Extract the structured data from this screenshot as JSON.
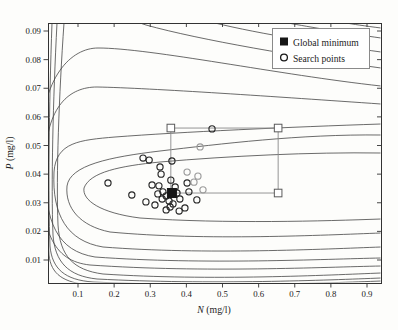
{
  "figure": {
    "background": "#fdfdfb",
    "axis_color": "#333333",
    "contour_color": "#454545",
    "point_color": "#262626",
    "shaded_point_color": "#9b9b9b",
    "region_color": "#8a8a8a",
    "minimum_color": "#161616"
  },
  "legend": {
    "items": [
      {
        "label": "Global minimum",
        "marker": "filled-square"
      },
      {
        "label": "Search points",
        "marker": "open-circle"
      }
    ]
  },
  "axes": {
    "x": {
      "variable": "N",
      "unit": " (mg/l)",
      "tick_labels": [
        "0.1",
        "0.2",
        "0.3",
        "0.4",
        "0.5",
        "0.6",
        "0.7",
        "0.8",
        "0.9"
      ],
      "tick_values": [
        0.1,
        0.2,
        0.3,
        0.4,
        0.5,
        0.6,
        0.7,
        0.8,
        0.9
      ]
    },
    "y": {
      "variable": "P",
      "unit": " (mg/l)",
      "tick_labels": [
        "0.01",
        "0.02",
        "0.03",
        "0.04",
        "0.05",
        "0.06",
        "0.07",
        "0.08",
        "0.09"
      ],
      "tick_values": [
        0.01,
        0.02,
        0.03,
        0.04,
        0.05,
        0.06,
        0.07,
        0.08,
        0.09
      ]
    }
  },
  "chart_data": {
    "type": "scatter",
    "subtype": "contour-plot-with-search-points",
    "title": "",
    "xlabel": "N (mg/l)",
    "ylabel": "P (mg/l)",
    "xlim": [
      0.017,
      0.939
    ],
    "ylim": [
      0.002,
      0.093
    ],
    "grid": false,
    "legend_position": "upper right",
    "global_minimum": {
      "N": 0.36,
      "P": 0.0334
    },
    "search_region": {
      "N_min": 0.357,
      "N_max": 0.654,
      "P_min": 0.0334,
      "P_max": 0.0561
    },
    "search_points": [
      [
        0.183,
        0.0369
      ],
      [
        0.249,
        0.0327
      ],
      [
        0.28,
        0.0456
      ],
      [
        0.297,
        0.0449
      ],
      [
        0.327,
        0.0425
      ],
      [
        0.33,
        0.04
      ],
      [
        0.288,
        0.0303
      ],
      [
        0.313,
        0.0292
      ],
      [
        0.305,
        0.0362
      ],
      [
        0.324,
        0.0359
      ],
      [
        0.335,
        0.0338
      ],
      [
        0.344,
        0.0324
      ],
      [
        0.333,
        0.0313
      ],
      [
        0.344,
        0.0275
      ],
      [
        0.355,
        0.0285
      ],
      [
        0.352,
        0.0306
      ],
      [
        0.36,
        0.0446
      ],
      [
        0.357,
        0.0379
      ],
      [
        0.369,
        0.0355
      ],
      [
        0.374,
        0.0334
      ],
      [
        0.382,
        0.0313
      ],
      [
        0.396,
        0.0282
      ],
      [
        0.402,
        0.0369
      ],
      [
        0.407,
        0.0338
      ],
      [
        0.429,
        0.031
      ],
      [
        0.363,
        0.0296
      ],
      [
        0.38,
        0.0271
      ],
      [
        0.471,
        0.0558
      ],
      [
        0.321,
        0.0331
      ]
    ],
    "shaded_search_points": [
      [
        0.438,
        0.0495
      ],
      [
        0.402,
        0.0407
      ],
      [
        0.432,
        0.0393
      ],
      [
        0.421,
        0.0372
      ],
      [
        0.446,
        0.0345
      ]
    ],
    "contour_levels": 9,
    "contours_px": [
      "M381,153 C310,152 230,156 160,162 C120,166 90,172 84,188 C82,200 100,213 140,218 C225,224 325,221 381,219",
      "M381,135 C300,134 220,144 160,151 C110,157 70,165 67,186 C65,208 80,226 110,232 C205,241 325,235 381,233",
      "M381,124 C290,127 180,132 115,137 C80,140 56,142 54,172 C52,215 67,241 103,247 C205,255 325,249 381,247",
      "M381,104 C280,97 150,88 97,87 C70,87 46,105 45,163 C44,224 58,251 95,257 C205,265 325,259 381,258",
      "M381,86 C280,75 150,48 98,48 C72,48 41,75 40,150 C39,233 53,261 90,265 C205,273 325,267 381,266",
      "M381,68 C300,57 200,40 146,25 C144,24 142,24 140,23 M64,23 C59,95 56,175 58,225 C60,256 73,270 103,274 C210,281 330,275 381,273",
      "M381,52 C330,45 260,34 215,23 M57,23 C53,100 51,185 53,235 C55,262 68,276 97,279 C210,285 330,280 381,278",
      "M381,38 C345,33 310,27 288,23 M52,23 C49,105 48,200 50,246 C52,269 65,280 93,282 C210,287 330,283 381,281",
      "M381,28 C365,26 352,24 346,23 M48.5,23 C47,115 47,215 49,255 C51,274 63,283 91,285 C200,289 330,285 381,284"
    ]
  }
}
